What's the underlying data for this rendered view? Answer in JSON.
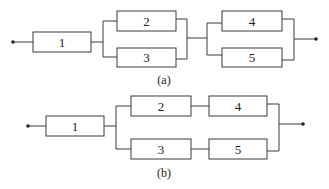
{
  "diagrams": [
    {
      "caption": "(a)",
      "description": "Block 1 in series with parallel pair (2,3), in series with parallel pair (4,5)",
      "blocks": [
        {
          "label": "1"
        },
        {
          "label": "2"
        },
        {
          "label": "3"
        },
        {
          "label": "4"
        },
        {
          "label": "5"
        }
      ]
    },
    {
      "caption": "(b)",
      "description": "Block 1 in series with two parallel paths: (2 then 4) and (3 then 5)",
      "blocks": [
        {
          "label": "1"
        },
        {
          "label": "2"
        },
        {
          "label": "4"
        },
        {
          "label": "3"
        },
        {
          "label": "5"
        }
      ]
    }
  ],
  "colors": {
    "line": "#3a3a3a",
    "text": "#222222",
    "background": "#ffffff"
  }
}
